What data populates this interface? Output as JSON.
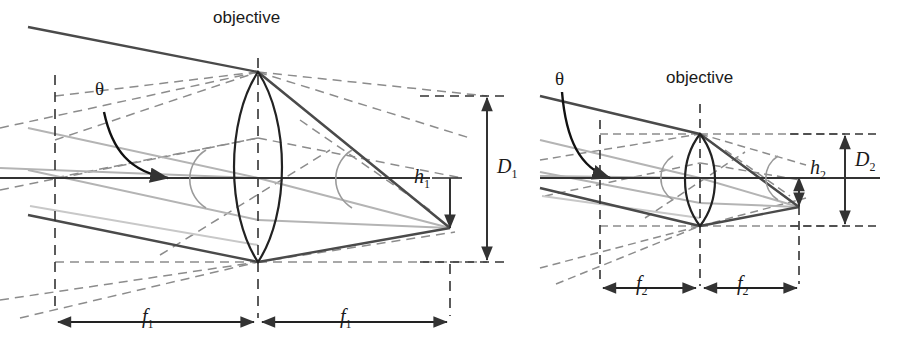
{
  "figure": {
    "title": "",
    "type": "optical-ray-diagram"
  },
  "panels": [
    {
      "id": "panel-left",
      "lens_label": "objective",
      "angle_label": "θ",
      "image_height_label": "h",
      "image_height_sub": "1",
      "aperture_label": "D",
      "aperture_sub": "1",
      "focal_label_left": "f",
      "focal_sub_left": "1",
      "focal_label_right": "f",
      "focal_sub_right": "1"
    },
    {
      "id": "panel-right",
      "lens_label": "objective",
      "angle_label": "θ",
      "image_height_label": "h",
      "image_height_sub": "2",
      "aperture_label": "D",
      "aperture_sub": "2",
      "focal_label_left": "f",
      "focal_sub_left": "2",
      "focal_label_right": "f",
      "focal_sub_right": "2"
    }
  ],
  "colors": {
    "ray_dark": "#4a4a4a",
    "ray_light": "#b4b4b4",
    "construction_dashed": "#8c8c8c",
    "axis": "#333333",
    "lens_outline": "#222222",
    "text": "#1a1a1a"
  },
  "geometry": {
    "panel1": {
      "lens_x": 258,
      "axis_y": 178,
      "lens_top_y": 72,
      "lens_bottom_y": 262,
      "front_focal_x": 55,
      "back_focal_x": 450,
      "image_point_y": 228,
      "aperture_arrow_x": 487,
      "aperture_top_y": 96,
      "aperture_bottom_y": 262,
      "f_dim_y": 322
    },
    "panel2": {
      "lens_x": 700,
      "axis_y": 178,
      "lens_top_y": 134,
      "lens_bottom_y": 226,
      "front_focal_x": 600,
      "back_focal_x": 799,
      "image_point_y": 207,
      "aperture_arrow_x": 845,
      "aperture_top_y": 134,
      "aperture_bottom_y": 226,
      "f_dim_y": 288
    }
  }
}
